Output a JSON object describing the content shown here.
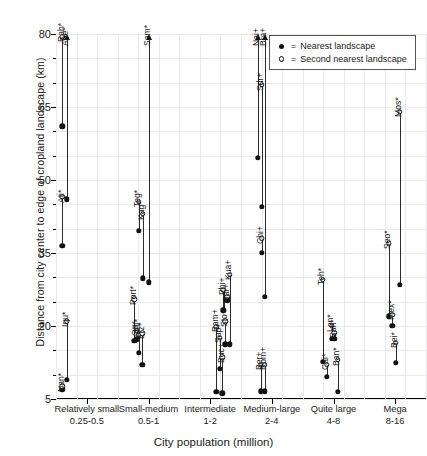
{
  "chart_data": {
    "type": "scatter",
    "title": "",
    "xlabel": "City population (million)",
    "ylabel": "Distance from city center to edge of cropland landscape (km)",
    "ylim": [
      5,
      80
    ],
    "yticks": [
      5,
      20,
      35,
      50,
      65,
      80
    ],
    "grid": true,
    "legend_position": "top-right",
    "legend": [
      {
        "symbol": "filled-circle",
        "prefix": "=",
        "label": "Nearest landscape"
      },
      {
        "symbol": "open-circle",
        "prefix": "=",
        "label": "Second nearest landscape"
      }
    ],
    "series": [
      {
        "name": "Nearest landscape",
        "marker": "filled-circle"
      },
      {
        "name": "Second nearest landscape",
        "marker": "open-circle"
      }
    ],
    "categories": [
      {
        "label": "Relatively small",
        "range": "0.25-0.5"
      },
      {
        "label": "Small-medium",
        "range": "0.5-1"
      },
      {
        "label": "Intermediate",
        "range": "1-2"
      },
      {
        "label": "Medium-large",
        "range": "2-4"
      },
      {
        "label": "Quite large",
        "range": "4-8"
      },
      {
        "label": "Mega",
        "range": "8-16"
      }
    ],
    "groups": [
      {
        "category": "Relatively small",
        "cities": [
          {
            "name": "Rah*",
            "x": 0.1,
            "nearest": 61.0,
            "second": 79.4,
            "second_clipped": false,
            "nearest_clipped": false,
            "label_at": "second"
          },
          {
            "name": "Abe*",
            "x": 0.175,
            "nearest": 46.0,
            "second": 80.0,
            "second_clipped": true,
            "label_at": "second"
          },
          {
            "name": "Ati*",
            "x": 0.1,
            "nearest": 36.5,
            "second": 46.5,
            "label_at": "second"
          },
          {
            "name": "Iqu*",
            "x": 0.175,
            "nearest": 9.0,
            "second": 21.0,
            "label_at": "second"
          },
          {
            "name": "Nan*",
            "x": 0.1,
            "nearest": 7.0,
            "second": 7.6,
            "label_at": "second"
          }
        ]
      },
      {
        "category": "Small-medium",
        "cities": [
          {
            "name": "Sam*",
            "x": 0.5,
            "nearest": 29.0,
            "second": 80.0,
            "second_clipped": true,
            "label_at": "second"
          },
          {
            "name": "Teg*",
            "x": 0.34,
            "nearest": 39.5,
            "second": 45.5,
            "label_at": "second"
          },
          {
            "name": "Kag*",
            "x": 0.41,
            "nearest": 29.8,
            "second": 43.0,
            "label_at": "second"
          },
          {
            "name": "Port*",
            "x": 0.27,
            "nearest": 17.0,
            "second": 25.5,
            "label_at": "second"
          },
          {
            "name": "Ott*",
            "x": 0.31,
            "nearest": 17.3,
            "second": 19.0,
            "label_at": "second"
          },
          {
            "name": "Edm*",
            "x": 0.345,
            "nearest": 14.5,
            "second": 18.2,
            "label_at": "second"
          },
          {
            "name": "Erz*",
            "x": 0.4,
            "nearest": 12.0,
            "second": 18.5,
            "label_at": "second"
          }
        ]
      },
      {
        "category": "Intermediate",
        "cities": [
          {
            "name": "Bam+",
            "x": 0.6,
            "nearest": 6.5,
            "second": 19.8,
            "label_at": "second"
          },
          {
            "name": "Sap+",
            "x": 0.655,
            "nearest": 11.2,
            "second": 17.6,
            "label_at": "second"
          },
          {
            "name": "Buc+",
            "x": 0.695,
            "nearest": 6.2,
            "second": 13.6,
            "label_at": "second"
          },
          {
            "name": "Phi+",
            "x": 0.715,
            "nearest": 23.2,
            "second": 27.4,
            "label_at": "second"
          },
          {
            "name": "Sto+",
            "x": 0.745,
            "nearest": 16.2,
            "second": 21.0,
            "label_at": "second"
          },
          {
            "name": "Bar+",
            "x": 0.775,
            "nearest": 25.3,
            "second": 26.0,
            "label_at": "second"
          },
          {
            "name": "Kua+",
            "x": 0.815,
            "nearest": 16.2,
            "second": 30.5,
            "label_at": "second"
          }
        ]
      },
      {
        "category": "Medium-large",
        "cities": [
          {
            "name": "Nai+",
            "x": 0.275,
            "nearest": 54.5,
            "second": 80.0,
            "second_clipped": true,
            "label_at": "second"
          },
          {
            "name": "Sdr+",
            "x": 0.335,
            "nearest": 44.5,
            "second": 69.5,
            "label_at": "second"
          },
          {
            "name": "Bra+",
            "x": 0.385,
            "nearest": 26.0,
            "second": 80.0,
            "second_clipped": true,
            "label_at": "second"
          },
          {
            "name": "Chi+",
            "x": 0.335,
            "nearest": 35.0,
            "second": 38.0,
            "label_at": "second"
          },
          {
            "name": "Ber+",
            "x": 0.325,
            "nearest": 6.6,
            "second": 12.0,
            "label_at": "second"
          },
          {
            "name": "Rom+",
            "x": 0.385,
            "nearest": 6.6,
            "second": 12.0,
            "label_at": "second"
          }
        ]
      },
      {
        "category": "Quite large",
        "cities": [
          {
            "name": "Teh*",
            "x": 0.33,
            "nearest": 12.6,
            "second": 29.5,
            "label_at": "second"
          },
          {
            "name": "Cai*",
            "x": 0.395,
            "nearest": 9.5,
            "second": 12.0,
            "label_at": "second"
          },
          {
            "name": "Lon*",
            "x": 0.47,
            "nearest": 17.4,
            "second": 20.0,
            "label_at": "second"
          },
          {
            "name": "San*",
            "x": 0.515,
            "nearest": 17.4,
            "second": 18.6,
            "label_at": "second"
          },
          {
            "name": "Ban*",
            "x": 0.565,
            "nearest": 6.5,
            "second": 13.0,
            "label_at": "second"
          }
        ]
      },
      {
        "category": "Mega",
        "cities": [
          {
            "name": "Seo*",
            "x": 0.4,
            "nearest": 22.0,
            "second": 37.0,
            "label_at": "second"
          },
          {
            "name": "Mex*",
            "x": 0.455,
            "nearest": 20.0,
            "second": 22.3,
            "label_at": "second"
          },
          {
            "name": "Bei*",
            "x": 0.515,
            "nearest": 12.5,
            "second": 16.6,
            "label_at": "second"
          },
          {
            "name": "Mos*",
            "x": 0.575,
            "nearest": 28.5,
            "second": 64.0,
            "label_at": "second"
          }
        ]
      }
    ]
  }
}
